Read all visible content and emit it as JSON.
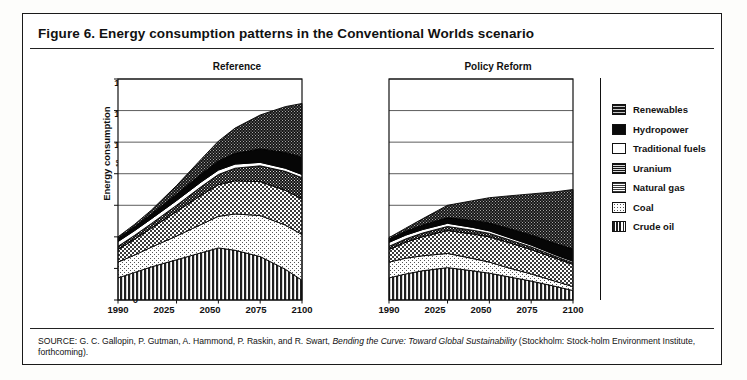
{
  "figure": {
    "title": "Figure 6. Energy consumption patterns in the Conventional Worlds scenario",
    "source_line1": "SOURCE: G. C. Gallopin, P. Gutman, A. Hammond, P. Raskin, and R. Swart, ",
    "source_italic": "Bending the Curve: Toward Global Sustainability",
    "source_line2": " (Stockholm: Stock-",
    "source_line3": "holm Environment Institute, forthcoming)."
  },
  "axis": {
    "ylabel_line1": "Energy consumption",
    "ylabel_line2_pre": "(10",
    "ylabel_line2_sup": "18",
    "ylabel_line2_post": " joules)",
    "yticks": [
      "1,400",
      "1,200",
      "1,000",
      "800",
      "600",
      "400",
      "200",
      "0"
    ],
    "ytick_values": [
      1400,
      1200,
      1000,
      800,
      600,
      400,
      200,
      0
    ],
    "xticks": [
      "1990",
      "2025",
      "2050",
      "2075",
      "2100"
    ],
    "xtick_values": [
      1990,
      2025,
      2050,
      2075,
      2100
    ],
    "ylim": [
      0,
      1400
    ],
    "xlim": [
      1990,
      2100
    ],
    "grid": "horizontal"
  },
  "legend": {
    "position": "right",
    "items": [
      {
        "label": "Renewables",
        "pattern": "dense-checker-dark",
        "color": "#1c1c1c"
      },
      {
        "label": "Hydropower",
        "pattern": "solid-black",
        "color": "#0a0a0a"
      },
      {
        "label": "Traditional fuels",
        "pattern": "white",
        "color": "#ffffff"
      },
      {
        "label": "Uranium",
        "pattern": "checker-dark",
        "color": "#2a2a2a"
      },
      {
        "label": "Natural gas",
        "pattern": "checker-medium",
        "color": "#595959"
      },
      {
        "label": "Coal",
        "pattern": "dotted-light",
        "color": "#ededed"
      },
      {
        "label": "Crude oil",
        "pattern": "vertical-stripes",
        "color": "#333333"
      }
    ]
  },
  "chart_data": [
    {
      "type": "area",
      "title": "Reference",
      "xlabel": "",
      "ylabel": "Energy consumption (10^18 joules)",
      "xlim": [
        1990,
        2100
      ],
      "ylim": [
        0,
        1400
      ],
      "grid": true,
      "stacked": true,
      "x": [
        1990,
        2000,
        2010,
        2025,
        2040,
        2050,
        2060,
        2075,
        2090,
        2100
      ],
      "series": [
        {
          "name": "Crude oil",
          "values": [
            140,
            175,
            210,
            255,
            300,
            330,
            315,
            275,
            195,
            125
          ]
        },
        {
          "name": "Coal",
          "values": [
            100,
            110,
            125,
            150,
            180,
            200,
            230,
            260,
            280,
            290
          ]
        },
        {
          "name": "Natural gas",
          "values": [
            80,
            100,
            120,
            155,
            185,
            200,
            210,
            215,
            220,
            225
          ]
        },
        {
          "name": "Uranium",
          "values": [
            20,
            25,
            30,
            40,
            55,
            65,
            80,
            100,
            120,
            135
          ]
        },
        {
          "name": "Traditional fuels",
          "values": [
            30,
            30,
            30,
            30,
            30,
            28,
            26,
            22,
            20,
            20
          ]
        },
        {
          "name": "Hydropower",
          "values": [
            20,
            25,
            30,
            40,
            50,
            58,
            68,
            85,
            100,
            110
          ]
        },
        {
          "name": "Renewables",
          "values": [
            10,
            15,
            25,
            55,
            95,
            125,
            160,
            215,
            290,
            340
          ]
        }
      ],
      "totals": [
        400,
        480,
        570,
        725,
        895,
        1006,
        1089,
        1172,
        1225,
        1245
      ]
    },
    {
      "type": "area",
      "title": "Policy Reform",
      "xlabel": "",
      "ylabel": "",
      "xlim": [
        1990,
        2100
      ],
      "ylim": [
        0,
        1400
      ],
      "grid": true,
      "stacked": true,
      "x": [
        1990,
        2000,
        2010,
        2025,
        2040,
        2050,
        2060,
        2075,
        2090,
        2100
      ],
      "series": [
        {
          "name": "Crude oil",
          "values": [
            140,
            165,
            185,
            205,
            185,
            170,
            150,
            120,
            85,
            60
          ]
        },
        {
          "name": "Coal",
          "values": [
            100,
            100,
            95,
            90,
            78,
            70,
            58,
            45,
            32,
            25
          ]
        },
        {
          "name": "Natural gas",
          "values": [
            80,
            100,
            120,
            145,
            155,
            160,
            160,
            155,
            145,
            140
          ]
        },
        {
          "name": "Uranium",
          "values": [
            20,
            22,
            24,
            26,
            24,
            22,
            20,
            16,
            12,
            10
          ]
        },
        {
          "name": "Traditional fuels",
          "values": [
            25,
            24,
            22,
            20,
            18,
            16,
            14,
            12,
            10,
            10
          ]
        },
        {
          "name": "Hydropower",
          "values": [
            20,
            24,
            28,
            36,
            44,
            50,
            56,
            64,
            72,
            78
          ]
        },
        {
          "name": "Renewables",
          "values": [
            10,
            20,
            40,
            78,
            125,
            160,
            200,
            260,
            330,
            377
          ]
        }
      ],
      "totals": [
        395,
        455,
        514,
        600,
        629,
        648,
        658,
        672,
        686,
        700
      ]
    }
  ]
}
